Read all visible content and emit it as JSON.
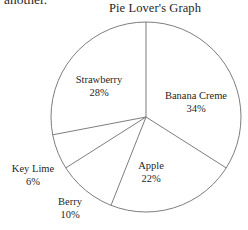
{
  "page": {
    "cutoff_text": "another.",
    "background_color": "#ffffff",
    "line_color": "#6e6e6e"
  },
  "chart_data": {
    "type": "pie",
    "title": "Pie Lover's Graph",
    "xlabel": "",
    "ylabel": "",
    "legend_position": "none",
    "grid": false,
    "labels_inline": true,
    "start_angle_deg": 0,
    "direction": "clockwise",
    "categories": [
      "Banana Creme",
      "Apple",
      "Berry",
      "Key Lime",
      "Strawberry"
    ],
    "values": [
      34,
      22,
      10,
      6,
      28
    ],
    "value_unit": "%",
    "slices": [
      {
        "name": "Banana Creme",
        "value": 34,
        "label_text": "Banana Creme",
        "percent_text": "34%"
      },
      {
        "name": "Apple",
        "value": 22,
        "label_text": "Apple",
        "percent_text": "22%"
      },
      {
        "name": "Berry",
        "value": 10,
        "label_text": "Berry",
        "percent_text": "10%"
      },
      {
        "name": "Key Lime",
        "value": 6,
        "label_text": "Key Lime",
        "percent_text": "6%"
      },
      {
        "name": "Strawberry",
        "value": 28,
        "label_text": "Strawberry",
        "percent_text": "28%"
      }
    ]
  }
}
